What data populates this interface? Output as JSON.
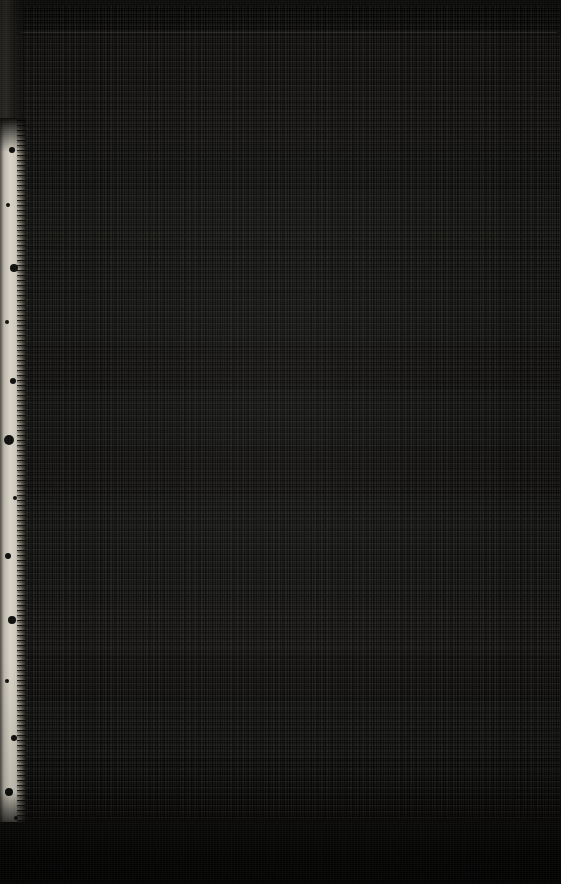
{
  "document": {
    "kind": "scanned-page",
    "legibility": "illegible",
    "description": "Severely underexposed photographic scan of a densely printed page",
    "visible_text": "",
    "title_text": "",
    "body_text": ""
  },
  "canvas": {
    "width_px": 561,
    "height_px": 884
  },
  "colors": {
    "background": "#050504",
    "paper_tone": "#111110",
    "ink_highlight": "#6b665c",
    "edge_strip_bright": "#d8d3c6",
    "edge_strip_mid": "#b9b4a8",
    "edge_strip_dark": "#4a4741",
    "bottom_margin": "#050504"
  },
  "regions": {
    "top_edge": {
      "label": "top page edge",
      "y_px": 0,
      "height_px": 8
    },
    "header_rule": {
      "label": "faint horizontal rule",
      "y_px": 32
    },
    "left_edge_strip": {
      "label": "torn bright page edge",
      "x_px": 0,
      "y_px": 118,
      "width_px": 26,
      "height_px": 714
    },
    "text_block": {
      "label": "dense body text area",
      "y_px": 36,
      "height_px": 780
    },
    "bottom_margin": {
      "label": "empty bottom margin",
      "y_px": 822,
      "height_px": 62
    }
  },
  "text_bands": [
    {
      "top": 36,
      "height": 46,
      "density": 0.4
    },
    {
      "top": 84,
      "height": 62,
      "density": 0.58
    },
    {
      "top": 148,
      "height": 40,
      "density": 0.34
    },
    {
      "top": 190,
      "height": 56,
      "density": 0.62
    },
    {
      "top": 248,
      "height": 44,
      "density": 0.48
    },
    {
      "top": 294,
      "height": 52,
      "density": 0.66
    },
    {
      "top": 348,
      "height": 38,
      "density": 0.42
    },
    {
      "top": 388,
      "height": 58,
      "density": 0.6
    },
    {
      "top": 448,
      "height": 44,
      "density": 0.38
    },
    {
      "top": 494,
      "height": 60,
      "density": 0.64
    },
    {
      "top": 556,
      "height": 42,
      "density": 0.44
    },
    {
      "top": 600,
      "height": 56,
      "density": 0.68
    },
    {
      "top": 658,
      "height": 40,
      "density": 0.4
    },
    {
      "top": 700,
      "height": 58,
      "density": 0.62
    },
    {
      "top": 760,
      "height": 36,
      "density": 0.34
    },
    {
      "top": 798,
      "height": 24,
      "density": 0.22
    }
  ],
  "edge_specks": [
    {
      "x": 12,
      "y": 150,
      "r": 3
    },
    {
      "x": 8,
      "y": 205,
      "r": 2
    },
    {
      "x": 14,
      "y": 268,
      "r": 4
    },
    {
      "x": 7,
      "y": 322,
      "r": 2
    },
    {
      "x": 13,
      "y": 381,
      "r": 3
    },
    {
      "x": 9,
      "y": 440,
      "r": 5
    },
    {
      "x": 15,
      "y": 498,
      "r": 2
    },
    {
      "x": 8,
      "y": 556,
      "r": 3
    },
    {
      "x": 12,
      "y": 620,
      "r": 4
    },
    {
      "x": 7,
      "y": 681,
      "r": 2
    },
    {
      "x": 14,
      "y": 738,
      "r": 3
    },
    {
      "x": 9,
      "y": 792,
      "r": 4
    },
    {
      "x": 16,
      "y": 818,
      "r": 2
    }
  ]
}
